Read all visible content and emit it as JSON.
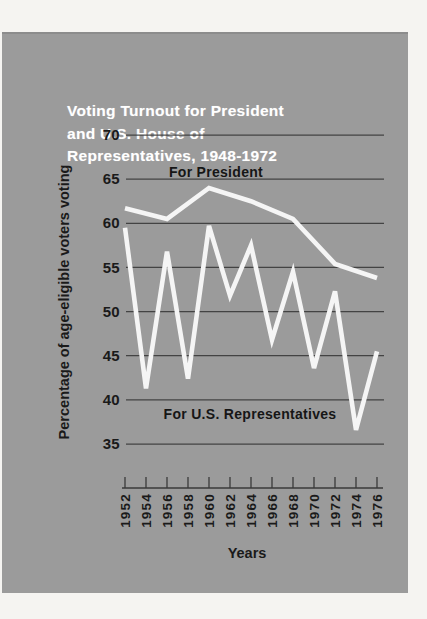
{
  "window": {
    "background": "#f5f4f1"
  },
  "card": {
    "background": "#9b9b9b"
  },
  "chart_data": {
    "type": "line",
    "title": "Voting Turnout for President and U.S. House of Representatives, 1948-1972",
    "title_lines": [
      "Voting Turnout for President",
      "and U.S. House of",
      "Representatives, 1948-1972"
    ],
    "xlabel": "Years",
    "ylabel": "Percentage of age-eligible voters voting",
    "ylim": [
      35,
      70
    ],
    "yticks": [
      70,
      65,
      60,
      55,
      50,
      45,
      40,
      35
    ],
    "xticks": [
      1952,
      1954,
      1956,
      1958,
      1960,
      1962,
      1964,
      1966,
      1968,
      1970,
      1972,
      1974,
      1976
    ],
    "grid": "horizontal-only",
    "legend_position": "inline-annotations",
    "colors": {
      "line": "#f5f5f5",
      "grid": "#3a3a3a",
      "tick_text": "#1a1a1a",
      "annotation_text": "#161616",
      "title_text": "#ffffff"
    },
    "series": [
      {
        "name": "For President",
        "x": [
          1952,
          1956,
          1960,
          1964,
          1968,
          1972,
          1976
        ],
        "values": [
          61.7,
          60.5,
          64.0,
          62.5,
          60.5,
          55.4,
          53.8
        ]
      },
      {
        "name": "For U.S. Representatives",
        "x": [
          1952,
          1954,
          1956,
          1958,
          1960,
          1962,
          1964,
          1966,
          1968,
          1970,
          1972,
          1974,
          1976
        ],
        "values": [
          59.5,
          41.3,
          56.8,
          42.4,
          59.7,
          51.8,
          57.5,
          46.8,
          54.5,
          43.6,
          52.3,
          36.6,
          45.5
        ]
      }
    ]
  }
}
